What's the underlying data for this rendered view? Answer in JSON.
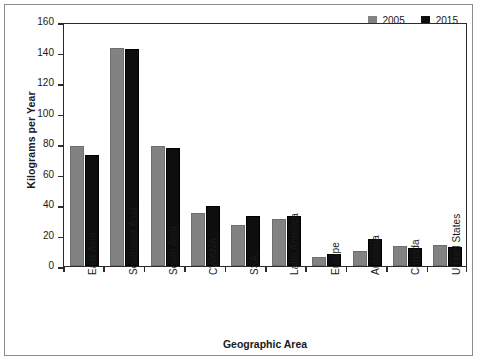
{
  "chart_data": {
    "type": "bar",
    "title": "",
    "xlabel": "Geographic Area",
    "ylabel": "Kilograms per Year",
    "ylim": [
      0,
      160
    ],
    "ytick_step": 20,
    "yticks": [
      0,
      20,
      40,
      60,
      80,
      100,
      120,
      140,
      160
    ],
    "grid": false,
    "legend_position": "top-right",
    "categories": [
      "East Asia",
      "Southeast Asia",
      "South Asia",
      "CWANA",
      "SSA",
      "Latin America",
      "Europe",
      "Australia",
      "Canada",
      "United States"
    ],
    "series": [
      {
        "name": "2005",
        "color": "#828282",
        "values": [
          79,
          143,
          79,
          35,
          27,
          31,
          6,
          10,
          13,
          13.5
        ]
      },
      {
        "name": "2015",
        "color": "#0e0e0e",
        "values": [
          73,
          142,
          77.5,
          39.5,
          33,
          32.5,
          8,
          18,
          11.5,
          12.5
        ]
      }
    ]
  },
  "legend": {
    "entries": [
      {
        "label": "2005",
        "color": "#828282"
      },
      {
        "label": "2015",
        "color": "#0e0e0e"
      }
    ]
  }
}
